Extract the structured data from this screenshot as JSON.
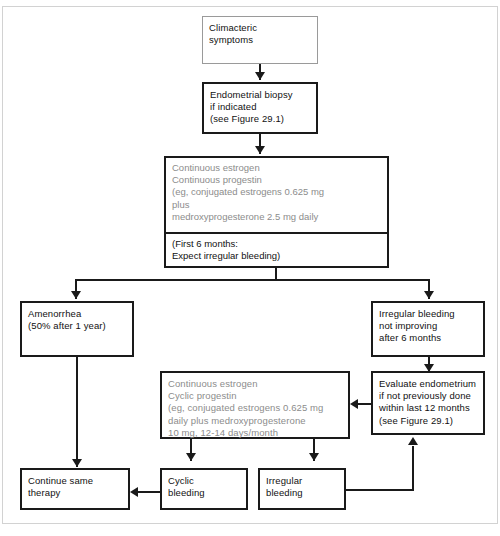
{
  "diagram": {
    "colors": {
      "line": "#1a1a1a",
      "gray_text": "#8c8c8c",
      "gray_border": "#9a9a9a",
      "frame": "#d2d2d2",
      "background": "#ffffff"
    },
    "nodes": {
      "climacteric_symptoms": "Climacteric\nsymptoms",
      "endometrial_biopsy": "Endometrial biopsy\nif indicated\n(see Figure 29.1)",
      "continuous_regimen_top": "Continuous estrogen\nContinuous progestin\n(eg, conjugated estrogens 0.625 mg\nplus\nmedroxyprogesterone 2.5 mg daily",
      "continuous_regimen_bottom": "(First 6 months:\nExpect irregular bleeding)",
      "amenorrhea": "Amenorrhea\n(50% after 1 year)",
      "irregular_bleeding_not_improving": "Irregular bleeding\nnot improving\nafter 6 months",
      "cyclic_regimen": "Continuous estrogen\nCyclic progestin\n(eg, conjugated estrogens 0.625 mg\ndaily plus medroxyprogesterone\n10 mg, 12-14 days/month",
      "evaluate_endometrium": "Evaluate endometrium\nif not previously done\nwithin last 12 months\n(see Figure 29.1)",
      "continue_same_therapy": "Continue same\ntherapy",
      "cyclic_bleeding": "Cyclic\nbleeding",
      "irregular_bleeding": "Irregular\nbleeding"
    }
  }
}
